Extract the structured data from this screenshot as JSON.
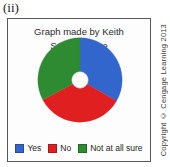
{
  "figure": {
    "label": "(ii)"
  },
  "chart_data": {
    "type": "pie",
    "title": "Graph made by Keith",
    "subtitle": "Some college",
    "xlabel": "",
    "ylabel": "",
    "donut": true,
    "donut_hole_ratio": 0.19,
    "start_angle_deg": 0,
    "legend_position": "bottom",
    "grid": false,
    "categories": [
      "Yes",
      "No",
      "Not at all sure"
    ],
    "values": [
      33,
      34,
      33
    ],
    "colors": [
      "#3366CC",
      "#E02020",
      "#2E8B32"
    ],
    "slices": [
      {
        "label": "Yes",
        "value": 33,
        "color": "#3366CC",
        "start_deg": 0,
        "end_deg": 120
      },
      {
        "label": "No",
        "value": 34,
        "color": "#E02020",
        "start_deg": 120,
        "end_deg": 242
      },
      {
        "label": "Not at all sure",
        "value": 33,
        "color": "#2E8B32",
        "start_deg": 242,
        "end_deg": 360
      }
    ]
  },
  "legend": {
    "items": [
      {
        "label": "Yes",
        "color": "#3366CC"
      },
      {
        "label": "No",
        "color": "#E02020"
      },
      {
        "label": "Not at all sure",
        "color": "#2E8B32"
      }
    ]
  },
  "copyright": {
    "text": "Copyright © Cengage Learning 2013"
  }
}
